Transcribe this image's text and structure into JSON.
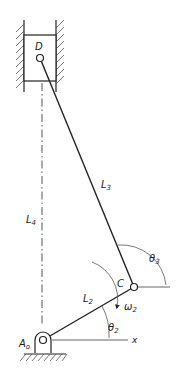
{
  "diagram": {
    "type": "slider-crank mechanism (inverted, vertical slider)",
    "labels": {
      "D": "D",
      "C": "C",
      "A0": "A",
      "A0_sub": "o",
      "L2": "L",
      "L2_sub": "2",
      "L3": "L",
      "L3_sub": "3",
      "L4": "L",
      "L4_sub": "4",
      "theta2": "θ",
      "theta2_sub": "2",
      "theta3": "θ",
      "theta3_sub": "3",
      "omega2": "ω",
      "omega2_sub": "2",
      "x_axis": "x"
    },
    "colors": {
      "line": "#222222",
      "hatch": "#555555",
      "background": "#ffffff"
    }
  }
}
